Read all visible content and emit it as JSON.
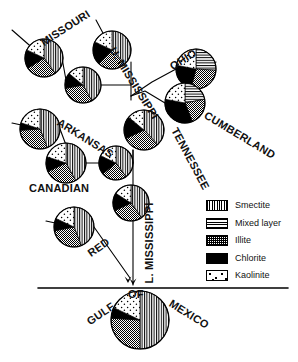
{
  "figure": {
    "domain": "diagram",
    "kind": "river-basin-clay-mineralogy-map",
    "width": 298,
    "height": 362,
    "background": "#ffffff",
    "line_color": "#000000"
  },
  "legend": {
    "position": "right-middle",
    "items": [
      {
        "id": "smectite",
        "label": "Smectite",
        "pattern": "vertical-lines",
        "color": "#000000"
      },
      {
        "id": "mixed",
        "label": "Mixed layer",
        "pattern": "horizontal-lines",
        "color": "#000000"
      },
      {
        "id": "illite",
        "label": "Illite",
        "pattern": "cross-hatch",
        "color": "#000000"
      },
      {
        "id": "chlorite",
        "label": "Chlorite",
        "pattern": "solid-black",
        "color": "#000000"
      },
      {
        "id": "kaolinite",
        "label": "Kaolinite",
        "pattern": "stipple-dots",
        "color": "#000000"
      }
    ]
  },
  "labels": [
    {
      "id": "missouri",
      "text": "MISSOURI",
      "x": 42,
      "y": 38,
      "rotate": -33,
      "size": 11
    },
    {
      "id": "u-mississippi",
      "text": "U. MISSISSIPPI",
      "x": 112,
      "y": 43,
      "rotate": 58,
      "size": 11
    },
    {
      "id": "ohio",
      "text": "OHIO",
      "x": 171,
      "y": 62,
      "rotate": -32,
      "size": 11
    },
    {
      "id": "cumberland",
      "text": "CUMBERLAND",
      "x": 205,
      "y": 109,
      "rotate": 31,
      "size": 11
    },
    {
      "id": "tennessee",
      "text": "TENNESSEE",
      "x": 174,
      "y": 123,
      "rotate": 62,
      "size": 11
    },
    {
      "id": "arkansas",
      "text": "ARKANSAS",
      "x": 58,
      "y": 116,
      "rotate": 32,
      "size": 11
    },
    {
      "id": "canadian",
      "text": "CANADIAN",
      "x": 29,
      "y": 183,
      "rotate": 0,
      "size": 11
    },
    {
      "id": "l-mississippi",
      "text": "L. MISSISSIPPI",
      "x": 149,
      "y": 278,
      "rotate": -90,
      "size": 11
    },
    {
      "id": "red",
      "text": "RED",
      "x": 89,
      "y": 249,
      "rotate": -35,
      "size": 11
    },
    {
      "id": "gulf",
      "text": "GULF",
      "x": 88,
      "y": 317,
      "rotate": -34,
      "size": 11
    },
    {
      "id": "of",
      "text": "OF",
      "x": 128,
      "y": 289,
      "rotate": 0,
      "size": 11
    },
    {
      "id": "mexico",
      "text": "MEXICO",
      "x": 170,
      "y": 297,
      "rotate": 32,
      "size": 11
    }
  ],
  "pies": [
    {
      "id": "missouri-upper",
      "cx": 44,
      "cy": 58,
      "r": 19,
      "slices": [
        {
          "m": "smectite",
          "pct": 40
        },
        {
          "m": "illite",
          "pct": 26
        },
        {
          "m": "chlorite",
          "pct": 16
        },
        {
          "m": "kaolinite",
          "pct": 18
        }
      ]
    },
    {
      "id": "missouri-lower",
      "cx": 83,
      "cy": 85,
      "r": 18,
      "slices": [
        {
          "m": "smectite",
          "pct": 42
        },
        {
          "m": "illite",
          "pct": 30
        },
        {
          "m": "chlorite",
          "pct": 14
        },
        {
          "m": "kaolinite",
          "pct": 14
        }
      ]
    },
    {
      "id": "u-mississippi-up",
      "cx": 112,
      "cy": 50,
      "r": 19,
      "slices": [
        {
          "m": "smectite",
          "pct": 38
        },
        {
          "m": "illite",
          "pct": 24
        },
        {
          "m": "chlorite",
          "pct": 20
        },
        {
          "m": "kaolinite",
          "pct": 18
        }
      ]
    },
    {
      "id": "u-mississippi-lo",
      "cx": 144,
      "cy": 130,
      "r": 20,
      "slices": [
        {
          "m": "smectite",
          "pct": 38
        },
        {
          "m": "illite",
          "pct": 30
        },
        {
          "m": "chlorite",
          "pct": 18
        },
        {
          "m": "kaolinite",
          "pct": 14
        }
      ]
    },
    {
      "id": "ohio",
      "cx": 196,
      "cy": 69,
      "r": 20,
      "slices": [
        {
          "m": "mixed",
          "pct": 26
        },
        {
          "m": "illite",
          "pct": 28
        },
        {
          "m": "chlorite",
          "pct": 24
        },
        {
          "m": "kaolinite",
          "pct": 22
        }
      ]
    },
    {
      "id": "cumberland",
      "cx": 185,
      "cy": 103,
      "r": 20,
      "slices": [
        {
          "m": "mixed",
          "pct": 22
        },
        {
          "m": "illite",
          "pct": 22
        },
        {
          "m": "chlorite",
          "pct": 34
        },
        {
          "m": "kaolinite",
          "pct": 22
        }
      ]
    },
    {
      "id": "arkansas-upper",
      "cx": 40,
      "cy": 129,
      "r": 20,
      "slices": [
        {
          "m": "smectite",
          "pct": 44
        },
        {
          "m": "illite",
          "pct": 30
        },
        {
          "m": "chlorite",
          "pct": 6
        },
        {
          "m": "kaolinite",
          "pct": 20
        }
      ]
    },
    {
      "id": "arkansas-mid",
      "cx": 66,
      "cy": 163,
      "r": 20,
      "slices": [
        {
          "m": "smectite",
          "pct": 42
        },
        {
          "m": "illite",
          "pct": 26
        },
        {
          "m": "chlorite",
          "pct": 12
        },
        {
          "m": "kaolinite",
          "pct": 20
        }
      ]
    },
    {
      "id": "arkansas-lower",
      "cx": 116,
      "cy": 163,
      "r": 17,
      "slices": [
        {
          "m": "smectite",
          "pct": 40
        },
        {
          "m": "illite",
          "pct": 24
        },
        {
          "m": "chlorite",
          "pct": 18
        },
        {
          "m": "kaolinite",
          "pct": 18
        }
      ]
    },
    {
      "id": "l-mississippi-up",
      "cx": 131,
      "cy": 203,
      "r": 18,
      "slices": [
        {
          "m": "smectite",
          "pct": 40
        },
        {
          "m": "illite",
          "pct": 28
        },
        {
          "m": "chlorite",
          "pct": 16
        },
        {
          "m": "kaolinite",
          "pct": 16
        }
      ]
    },
    {
      "id": "red",
      "cx": 74,
      "cy": 227,
      "r": 20,
      "slices": [
        {
          "m": "smectite",
          "pct": 44
        },
        {
          "m": "illite",
          "pct": 28
        },
        {
          "m": "chlorite",
          "pct": 10
        },
        {
          "m": "kaolinite",
          "pct": 18
        }
      ]
    },
    {
      "id": "gulf-of-mexico",
      "cx": 140,
      "cy": 320,
      "r": 29,
      "slices": [
        {
          "m": "smectite",
          "pct": 50
        },
        {
          "m": "illite",
          "pct": 26
        },
        {
          "m": "chlorite",
          "pct": 6
        },
        {
          "m": "kaolinite",
          "pct": 18
        }
      ]
    }
  ],
  "connectors": [
    {
      "id": "missouri-inflow",
      "points": "12,30 44,58"
    },
    {
      "id": "missouri-link",
      "points": "62,58 66,80 65,80"
    },
    {
      "id": "missouri-to-trunk",
      "points": "101,85 131,85 131,100"
    },
    {
      "id": "umiss-inflow",
      "points": "96,20 112,50"
    },
    {
      "id": "umiss-trunk",
      "points": "131,85 131,62"
    },
    {
      "id": "ohio-inflow",
      "points": "216,62 196,69"
    },
    {
      "id": "ohio-to-trunk",
      "points": "176,69 152,82 131,96"
    },
    {
      "id": "cumb-to-trunk",
      "points": "165,103 145,91 131,96"
    },
    {
      "id": "ark-inflow",
      "points": "12,123 40,129"
    },
    {
      "id": "ark-to-mid",
      "points": "60,129 66,145"
    },
    {
      "id": "ark-mid-to-low",
      "points": "86,163 99,163"
    },
    {
      "id": "ark-low-to-trunk",
      "points": "133,163 133,150"
    },
    {
      "id": "trunk-main",
      "points": "133,150 133,285"
    },
    {
      "id": "red-inflow",
      "points": "46,221 74,227"
    },
    {
      "id": "red-to-trunk",
      "points": "94,227 130,278"
    },
    {
      "id": "coastline",
      "points": "38,288 288,288"
    }
  ],
  "arrows": [
    {
      "id": "trunk-arrow",
      "x": 133,
      "y": 285
    },
    {
      "id": "red-arrow",
      "x": 128,
      "y": 283
    }
  ]
}
